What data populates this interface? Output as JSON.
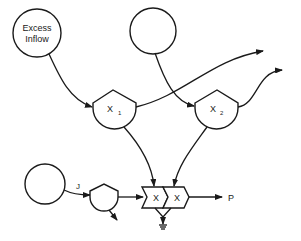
{
  "diagram": {
    "type": "energy-flow",
    "colors": {
      "line": "#1a1a1a",
      "background": "#ffffff"
    },
    "nodes": {
      "excess_inflow": {
        "label_line1": "Excess",
        "label_line2": "Inflow",
        "shape": "circle-source"
      },
      "source_top": {
        "label": "",
        "shape": "circle-source"
      },
      "source_bottom": {
        "label": "",
        "shape": "circle-source"
      },
      "x1": {
        "label": "X",
        "subscript": "1",
        "shape": "interaction-pentagon"
      },
      "x2": {
        "label": "X",
        "subscript": "2",
        "shape": "interaction-pentagon"
      },
      "j_valve": {
        "label": "",
        "shape": "interaction-pentagon-small"
      },
      "mult1": {
        "label": "X",
        "shape": "multiplier-chevron"
      },
      "mult2": {
        "label": "X",
        "shape": "multiplier-chevron"
      },
      "heat_sink": {
        "label": "",
        "shape": "ground-heat-sink"
      }
    },
    "flows": {
      "j_label": "J",
      "p_label": "P"
    },
    "edges": [
      {
        "from": "excess_inflow",
        "to": "x1"
      },
      {
        "from": "source_top",
        "to": "x2"
      },
      {
        "from": "x1",
        "to": "out-right-1"
      },
      {
        "from": "x2",
        "to": "out-right-2"
      },
      {
        "from": "x1",
        "to": "mult1"
      },
      {
        "from": "x2",
        "to": "mult2"
      },
      {
        "from": "source_bottom",
        "to": "j_valve",
        "label": "J"
      },
      {
        "from": "j_valve",
        "to": "mult1"
      },
      {
        "from": "j_valve",
        "to": "out-down"
      },
      {
        "from": "mult2",
        "to": "P",
        "label": "P"
      },
      {
        "from": "mult1",
        "to": "heat_sink"
      }
    ]
  }
}
